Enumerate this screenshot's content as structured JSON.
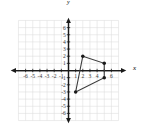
{
  "figure": {
    "kind": "coordinate-plane",
    "x_axis_name": "x",
    "y_axis_name": "y"
  },
  "chart_data": {
    "type": "scatter",
    "title": "",
    "xlabel": "x",
    "ylabel": "y",
    "xlim": [
      -7,
      7
    ],
    "ylim": [
      -7,
      7
    ],
    "grid": true,
    "legend": null,
    "x_ticks": [
      -6,
      -5,
      -4,
      -3,
      -2,
      -1,
      1,
      2,
      3,
      4,
      5,
      6
    ],
    "y_ticks": [
      6,
      5,
      4,
      3,
      2,
      1,
      -1,
      -2,
      -3,
      -4,
      -5,
      -6
    ],
    "x_tick_labels": [
      "-6",
      "-5",
      "-4",
      "-3",
      "-2",
      "-1",
      "1",
      "2",
      "3",
      "4",
      "5",
      "6"
    ],
    "y_tick_labels": [
      "6",
      "5",
      "4",
      "3",
      "2",
      "1",
      "-1",
      "-2",
      "-3",
      "-4",
      "-5",
      "-6"
    ],
    "hidden_x_tick_labels": [
      "5"
    ],
    "series": [
      {
        "name": "quadrilateral",
        "type": "polygon",
        "closed": true,
        "stroke": "#3b3b3b",
        "marker": "filled-circle",
        "points": [
          {
            "x": 2,
            "y": 2
          },
          {
            "x": 5,
            "y": 1
          },
          {
            "x": 5,
            "y": -1
          },
          {
            "x": 1,
            "y": -3
          }
        ]
      }
    ]
  },
  "colors": {
    "grid": "#dcdcdc",
    "axis": "#1a1a1a",
    "shape_stroke": "#3b3b3b",
    "vertex_fill": "#1a1a1a",
    "tick_text": "#3a3a3a",
    "background": "#ffffff"
  },
  "labels": {
    "x_axis": "x",
    "y_axis": "y"
  }
}
